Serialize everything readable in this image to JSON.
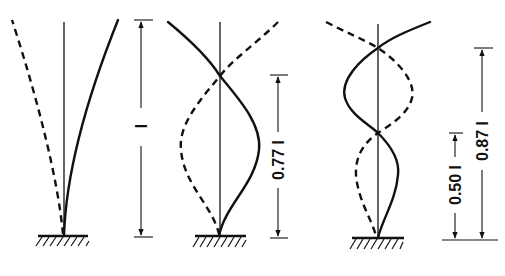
{
  "figure": {
    "panels": [
      {
        "id": "mode-1",
        "dimension_labels": [
          "l"
        ],
        "solid_curve": "first-mode-deflection",
        "dashed_curve": "first-mode-mirror"
      },
      {
        "id": "mode-2",
        "dimension_labels": [
          "0.77 l"
        ],
        "solid_curve": "second-mode-deflection",
        "dashed_curve": "second-mode-mirror"
      },
      {
        "id": "mode-3",
        "dimension_labels": [
          "0.50 l",
          "0.87 l"
        ],
        "solid_curve": "third-mode-deflection",
        "dashed_curve": "third-mode-mirror"
      }
    ]
  },
  "labels": {
    "mode1_length": "l",
    "mode2_length": "0.77 l",
    "mode3_lower": "0.50 l",
    "mode3_upper": "0.87 l"
  },
  "colors": {
    "line": "#111111",
    "background": "#ffffff"
  }
}
